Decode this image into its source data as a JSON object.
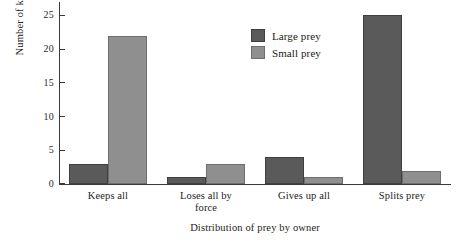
{
  "chart_data": {
    "type": "bar",
    "title": "",
    "subtitle": "",
    "xlabel": "Distribution of prey by owner",
    "ylabel": "Number of kills",
    "categories": [
      "Keeps all",
      "Loses all by force",
      "Gives up all",
      "Splits prey"
    ],
    "series": [
      {
        "name": "Large prey",
        "color": "#5a5a5a",
        "values": [
          3,
          1,
          4,
          25
        ]
      },
      {
        "name": "Small prey",
        "color": "#8f8f8f",
        "values": [
          22,
          3,
          1,
          2
        ]
      }
    ],
    "ylim": [
      0,
      27
    ],
    "yticks": [
      0,
      5,
      10,
      15,
      20,
      25
    ],
    "ytick_labels": [
      "0",
      "5",
      "10",
      "15",
      "20",
      "25"
    ],
    "grid": false,
    "legend_position": "top-center",
    "legend": [
      "Large prey",
      "Small prey"
    ]
  },
  "category_lines": [
    [
      "Keeps all"
    ],
    [
      "Loses all by",
      "force"
    ],
    [
      "Gives up all"
    ],
    [
      "Splits prey"
    ]
  ]
}
